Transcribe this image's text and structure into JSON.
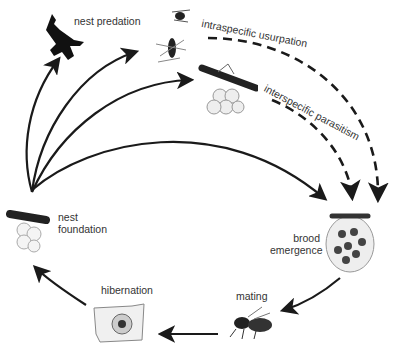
{
  "diagram": {
    "type": "life-cycle",
    "colors": {
      "arrow": "#1a1a1a",
      "text": "#333333",
      "background": "#ffffff"
    },
    "nodes": [
      {
        "id": "nest_predation",
        "label": "nest predation",
        "icon": "bird-icon"
      },
      {
        "id": "intraspecific_usurpation",
        "label": "intraspecific usurpation",
        "icon": "wasps-fighting-icon"
      },
      {
        "id": "interspecific_parasitism",
        "label": "interspecific parasitism",
        "icon": "parasite-wasp-on-nest-icon"
      },
      {
        "id": "brood_emergence",
        "label_line1": "brood",
        "label_line2": "emergence",
        "icon": "nest-with-brood-icon"
      },
      {
        "id": "mating",
        "label": "mating",
        "icon": "mating-wasps-icon"
      },
      {
        "id": "hibernation",
        "label": "hibernation",
        "icon": "hibernating-wasp-icon"
      },
      {
        "id": "nest_foundation",
        "label_line1": "nest",
        "label_line2": "foundation",
        "icon": "foundress-wasp-icon"
      }
    ],
    "edges": [
      {
        "from": "nest_foundation",
        "to": "nest_predation",
        "style": "solid"
      },
      {
        "from": "nest_foundation",
        "to": "intraspecific_usurpation",
        "style": "solid"
      },
      {
        "from": "nest_foundation",
        "to": "interspecific_parasitism",
        "style": "solid"
      },
      {
        "from": "nest_foundation",
        "to": "brood_emergence",
        "style": "solid"
      },
      {
        "from": "intraspecific_usurpation",
        "to": "brood_emergence",
        "style": "dashed"
      },
      {
        "from": "interspecific_parasitism",
        "to": "brood_emergence",
        "style": "dashed"
      },
      {
        "from": "brood_emergence",
        "to": "mating",
        "style": "solid"
      },
      {
        "from": "mating",
        "to": "hibernation",
        "style": "solid"
      },
      {
        "from": "hibernation",
        "to": "nest_foundation",
        "style": "solid"
      }
    ]
  }
}
